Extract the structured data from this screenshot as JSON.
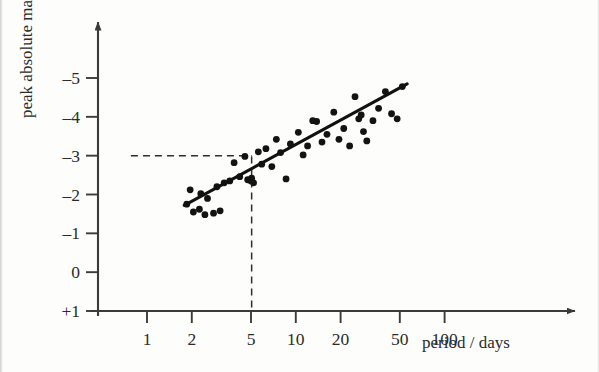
{
  "chart_data": {
    "type": "scatter",
    "title": "",
    "xlabel": "period / days",
    "ylabel": "peak absolute magnitude",
    "x_scale": "log",
    "x_tick_labels": [
      "1",
      "2",
      "5",
      "10",
      "20",
      "50",
      "100"
    ],
    "x_tick_values": [
      1,
      2,
      5,
      10,
      20,
      50,
      100
    ],
    "y_tick_labels": [
      "-5",
      "-4",
      "-3",
      "-2",
      "-1",
      "0",
      "+1"
    ],
    "y_tick_values": [
      -5,
      -4,
      -3,
      -2,
      -1,
      0,
      1
    ],
    "xlim": [
      0.78,
      170
    ],
    "ylim": [
      1,
      -5.6
    ],
    "grid": false,
    "legend": null,
    "series": [
      {
        "name": "Cepheid variables",
        "marker": "filled-circle",
        "color": "#131312",
        "points": [
          [
            1.85,
            -1.75
          ],
          [
            1.95,
            -2.12
          ],
          [
            2.05,
            -1.55
          ],
          [
            2.25,
            -1.62
          ],
          [
            2.3,
            -2.02
          ],
          [
            2.45,
            -1.48
          ],
          [
            2.55,
            -1.9
          ],
          [
            2.8,
            -1.52
          ],
          [
            2.95,
            -2.2
          ],
          [
            3.1,
            -1.58
          ],
          [
            3.3,
            -2.3
          ],
          [
            3.6,
            -2.35
          ],
          [
            3.85,
            -2.82
          ],
          [
            4.2,
            -2.46
          ],
          [
            4.55,
            -2.98
          ],
          [
            4.75,
            -2.38
          ],
          [
            5.0,
            -2.35
          ],
          [
            5.05,
            -2.42
          ],
          [
            5.2,
            -2.3
          ],
          [
            5.6,
            -3.1
          ],
          [
            5.9,
            -2.78
          ],
          [
            6.3,
            -3.18
          ],
          [
            6.9,
            -2.72
          ],
          [
            7.4,
            -3.42
          ],
          [
            7.9,
            -3.08
          ],
          [
            8.6,
            -2.4
          ],
          [
            9.2,
            -3.3
          ],
          [
            10.4,
            -3.6
          ],
          [
            11.2,
            -3.02
          ],
          [
            12.0,
            -3.25
          ],
          [
            13.0,
            -3.9
          ],
          [
            13.8,
            -3.88
          ],
          [
            15.0,
            -3.35
          ],
          [
            16.2,
            -3.55
          ],
          [
            18.0,
            -4.12
          ],
          [
            19.5,
            -3.42
          ],
          [
            21.0,
            -3.7
          ],
          [
            23.0,
            -3.25
          ],
          [
            25.0,
            -4.52
          ],
          [
            26.5,
            -3.95
          ],
          [
            27.5,
            -4.05
          ],
          [
            28.5,
            -3.62
          ],
          [
            30.0,
            -3.38
          ],
          [
            33.0,
            -3.9
          ],
          [
            36.0,
            -4.22
          ],
          [
            40.0,
            -4.65
          ],
          [
            44.0,
            -4.08
          ],
          [
            48.0,
            -3.95
          ],
          [
            52.0,
            -4.78
          ]
        ]
      }
    ],
    "trend_line": {
      "name": "best-fit line",
      "color": "#111110",
      "start": [
        1.78,
        -1.72
      ],
      "end": [
        56.0,
        -4.85
      ]
    },
    "annotations": [
      {
        "name": "guide-period-5",
        "type": "dashed-guide",
        "orientation": "vertical",
        "x": 5.05,
        "from_y": -2.98,
        "to_y": 1
      },
      {
        "name": "guide-magnitude-minus-3",
        "type": "dashed-guide",
        "orientation": "horizontal",
        "y": -3.0,
        "from_x": 0.78,
        "to_x": 5.05
      }
    ]
  }
}
